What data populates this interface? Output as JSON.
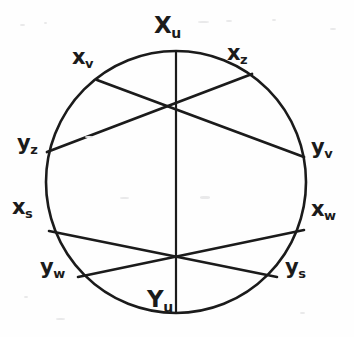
{
  "figure": {
    "stroke_color": "#1b1b1b",
    "background_color": "#fefefe",
    "circle": {
      "cx": 176,
      "cy": 182,
      "rx": 130,
      "ry": 131
    },
    "nodes": [
      {
        "id": "Xu",
        "base": "X",
        "sub": "u",
        "x": 176,
        "y": 51,
        "size": "big"
      },
      {
        "id": "xv",
        "base": "x",
        "sub": "v",
        "x": 97,
        "y": 80,
        "size": "normal"
      },
      {
        "id": "xz",
        "base": "x",
        "sub": "z",
        "x": 252,
        "y": 74,
        "size": "normal"
      },
      {
        "id": "yz",
        "base": "y",
        "sub": "z",
        "x": 47,
        "y": 152,
        "size": "normal"
      },
      {
        "id": "yv",
        "base": "y",
        "sub": "v",
        "x": 304,
        "y": 157,
        "size": "normal"
      },
      {
        "id": "xs",
        "base": "x",
        "sub": "s",
        "x": 49,
        "y": 231,
        "size": "normal"
      },
      {
        "id": "xw",
        "base": "x",
        "sub": "w",
        "x": 304,
        "y": 230,
        "size": "normal"
      },
      {
        "id": "yw",
        "base": "y",
        "sub": "w",
        "x": 78,
        "y": 277,
        "size": "normal"
      },
      {
        "id": "ys",
        "base": "y",
        "sub": "s",
        "x": 277,
        "y": 277,
        "size": "normal"
      },
      {
        "id": "Yu",
        "base": "Y",
        "sub": "u",
        "x": 176,
        "y": 313,
        "size": "big"
      }
    ],
    "chords": [
      {
        "id": "chord-Xu-Yu",
        "from": "Xu",
        "to": "Yu"
      },
      {
        "id": "chord-xv-yv",
        "from": "xv",
        "to": "yv"
      },
      {
        "id": "chord-xz-yz",
        "from": "xz",
        "to": "yz"
      },
      {
        "id": "chord-xs-ys",
        "from": "xs",
        "to": "ys"
      },
      {
        "id": "chord-xw-yw",
        "from": "xw",
        "to": "yw"
      }
    ],
    "intersections": [
      {
        "id": "upper-crossing",
        "x": 173,
        "y": 108
      },
      {
        "id": "lower-crossing",
        "x": 176,
        "y": 256
      }
    ]
  }
}
